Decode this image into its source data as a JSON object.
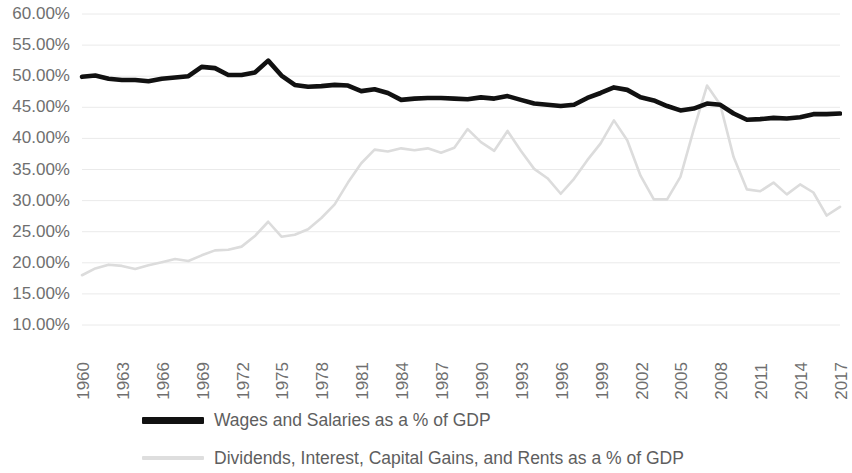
{
  "chart_data": {
    "type": "line",
    "title": "",
    "xlabel": "",
    "ylabel": "",
    "ylim": [
      10,
      60
    ],
    "ytick_labels": [
      "60.00%",
      "55.00%",
      "50.00%",
      "45.00%",
      "40.00%",
      "35.00%",
      "30.00%",
      "25.00%",
      "20.00%",
      "15.00%",
      "10.00%"
    ],
    "ytick_values": [
      60,
      55,
      50,
      45,
      40,
      35,
      30,
      25,
      20,
      15,
      10
    ],
    "grid": true,
    "legend_position": "bottom",
    "xlim": [
      1960,
      2017
    ],
    "xtick_labels": [
      "1960",
      "1963",
      "1966",
      "1969",
      "1972",
      "1975",
      "1978",
      "1981",
      "1984",
      "1987",
      "1990",
      "1993",
      "1996",
      "1999",
      "2002",
      "2005",
      "2008",
      "2011",
      "2014",
      "2017"
    ],
    "x": [
      1960,
      1961,
      1962,
      1963,
      1964,
      1965,
      1966,
      1967,
      1968,
      1969,
      1970,
      1971,
      1972,
      1973,
      1974,
      1975,
      1976,
      1977,
      1978,
      1979,
      1980,
      1981,
      1982,
      1983,
      1984,
      1985,
      1986,
      1987,
      1988,
      1989,
      1990,
      1991,
      1992,
      1993,
      1994,
      1995,
      1996,
      1997,
      1998,
      1999,
      2000,
      2001,
      2002,
      2003,
      2004,
      2005,
      2006,
      2007,
      2008,
      2009,
      2010,
      2011,
      2012,
      2013,
      2014,
      2015,
      2016,
      2017
    ],
    "series": [
      {
        "name": "Wages and Salaries as a % of GDP",
        "color": "#111111",
        "values": [
          49.9,
          50.1,
          49.6,
          49.4,
          49.4,
          49.2,
          49.6,
          49.8,
          50.0,
          51.5,
          51.3,
          50.2,
          50.2,
          50.6,
          52.5,
          50.1,
          48.6,
          48.3,
          48.4,
          48.6,
          48.5,
          47.6,
          47.9,
          47.3,
          46.2,
          46.4,
          46.5,
          46.5,
          46.4,
          46.3,
          46.6,
          46.4,
          46.8,
          46.2,
          45.6,
          45.4,
          45.2,
          45.4,
          46.5,
          47.3,
          48.2,
          47.8,
          46.6,
          46.1,
          45.2,
          44.5,
          44.8,
          45.6,
          45.4,
          44.0,
          43.0,
          43.1,
          43.3,
          43.2,
          43.4,
          43.9,
          43.9,
          44.0
        ]
      },
      {
        "name": "Dividends, Interest, Capital Gains, and Rents as a % of GDP",
        "color": "#dcdcdc",
        "values": [
          18.0,
          19.1,
          19.7,
          19.5,
          19.0,
          19.6,
          20.1,
          20.6,
          20.3,
          21.2,
          22.0,
          22.1,
          22.6,
          24.3,
          26.6,
          24.2,
          24.5,
          25.4,
          27.2,
          29.4,
          32.9,
          36.0,
          38.2,
          37.9,
          38.4,
          38.1,
          38.4,
          37.7,
          38.5,
          41.5,
          39.4,
          38.0,
          41.2,
          38.0,
          35.1,
          33.6,
          31.1,
          33.5,
          36.5,
          39.2,
          42.9,
          39.7,
          34.0,
          30.2,
          30.2,
          33.8,
          41.4,
          48.5,
          45.4,
          37.0,
          31.8,
          31.5,
          32.9,
          31.0,
          32.6,
          31.3,
          27.6,
          29.0
        ]
      }
    ]
  },
  "legend": {
    "items": [
      {
        "label": "Wages and Salaries as a % of GDP",
        "swatch": "dark"
      },
      {
        "label": "Dividends, Interest, Capital Gains, and Rents as a % of GDP",
        "swatch": "light"
      }
    ]
  },
  "colors": {
    "wages_line": "#111111",
    "capital_line": "#dcdcdc",
    "grid": "#eaeaea",
    "tick_text": "#6f6f6f",
    "legend_text": "#5e5e5e",
    "background": "#ffffff"
  }
}
